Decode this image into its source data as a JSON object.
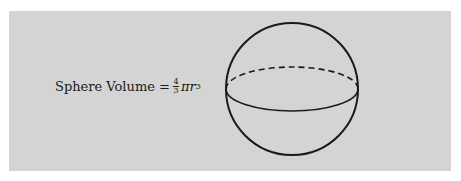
{
  "figure": {
    "label": "Sphere Volume",
    "equals": "=",
    "fraction": {
      "numerator": "4",
      "denominator": "3"
    },
    "pi": "π",
    "variable": "r",
    "exponent": "3"
  },
  "colors": {
    "panel": "#d4d4d4",
    "ink": "#1a1a1a",
    "background": "#ffffff"
  }
}
